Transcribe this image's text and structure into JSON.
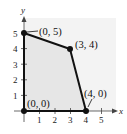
{
  "diagram": {
    "type": "feasible-region",
    "axes": {
      "x_label": "x",
      "y_label": "y",
      "x_ticks": [
        "1",
        "2",
        "3",
        "4",
        "5"
      ],
      "y_ticks": [
        "1",
        "2",
        "3",
        "4",
        "5"
      ]
    },
    "vertices": [
      {
        "label": "(0, 0)",
        "x": 0,
        "y": 0
      },
      {
        "label": "(0, 5)",
        "x": 0,
        "y": 5
      },
      {
        "label": "(3, 4)",
        "x": 3,
        "y": 4
      },
      {
        "label": "(4, 0)",
        "x": 4,
        "y": 0
      }
    ],
    "colors": {
      "region_fill": "#ececec",
      "boundary": "#111111",
      "axis": "#444444"
    }
  }
}
